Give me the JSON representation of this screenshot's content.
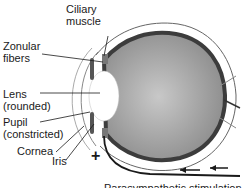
{
  "diagram": {
    "labels": {
      "ciliary_muscle": [
        "Ciliary",
        "muscle"
      ],
      "zonular_fibers": [
        "Zonular",
        "fibers"
      ],
      "lens": [
        "Lens",
        "(rounded)"
      ],
      "pupil": [
        "Pupil",
        "(constricted)"
      ],
      "cornea": "Cornea",
      "iris": "Iris"
    },
    "symbol": "+",
    "caption": "Parasympathetic stimulation",
    "colors": {
      "eyeball_fill": "#9a9a9a",
      "sclera": "#4a4a4a",
      "outline": "#777777",
      "lens": "#ffffff",
      "line": "#1a1a1a"
    }
  }
}
